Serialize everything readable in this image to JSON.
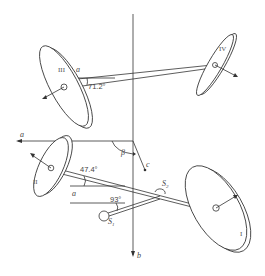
{
  "diagram": {
    "type": "wheel-axle geometry",
    "wheels": [
      {
        "id": "I",
        "label": "I"
      },
      {
        "id": "II",
        "label": "II"
      },
      {
        "id": "III",
        "label": "III"
      },
      {
        "id": "IV",
        "label": "IV"
      }
    ],
    "axes": {
      "a_label": "a",
      "b_label": "b",
      "c_label": "c"
    },
    "angles": {
      "upper": "71.2°",
      "middle": "47.4°",
      "lower": "93°",
      "beta": "β"
    },
    "points": {
      "s1": "S",
      "s1_sub": "1",
      "s2": "S",
      "s2_sub": "2"
    }
  }
}
